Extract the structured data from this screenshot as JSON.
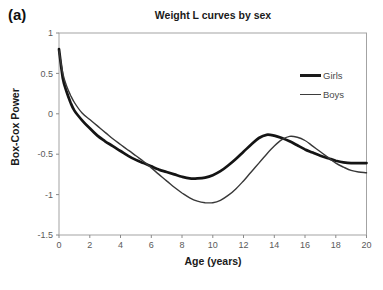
{
  "figure": {
    "panel_label": "(a)"
  },
  "chart_data": {
    "type": "line",
    "title": "Weight L curves by sex",
    "xlabel": "Age (years)",
    "ylabel": "Box-Cox Power",
    "xlim": [
      0,
      20
    ],
    "ylim": [
      -1.5,
      1
    ],
    "x_ticks": [
      0,
      2,
      4,
      6,
      8,
      10,
      12,
      14,
      16,
      18,
      20
    ],
    "y_ticks": [
      1,
      0.5,
      0,
      -0.5,
      -1,
      -1.5
    ],
    "y_tick_labels": [
      "1",
      "0.5",
      "0",
      "-0.5",
      "-1",
      "-1.5"
    ],
    "grid": false,
    "legend_position": "upper-right-inside",
    "x": [
      0,
      0.25,
      0.5,
      0.75,
      1,
      1.5,
      2,
      2.5,
      3,
      3.5,
      4,
      4.5,
      5,
      5.5,
      6,
      6.5,
      7,
      7.5,
      8,
      8.5,
      9,
      9.5,
      10,
      10.5,
      11,
      11.5,
      12,
      12.5,
      13,
      13.5,
      14,
      14.5,
      15,
      15.5,
      16,
      16.5,
      17,
      17.5,
      18,
      18.5,
      19,
      19.5,
      20
    ],
    "series": [
      {
        "name": "Girls",
        "style": "thick",
        "values": [
          0.8,
          0.44,
          0.27,
          0.14,
          0.04,
          -0.08,
          -0.18,
          -0.27,
          -0.34,
          -0.4,
          -0.46,
          -0.52,
          -0.57,
          -0.61,
          -0.65,
          -0.69,
          -0.72,
          -0.75,
          -0.78,
          -0.8,
          -0.8,
          -0.79,
          -0.76,
          -0.71,
          -0.64,
          -0.56,
          -0.47,
          -0.38,
          -0.3,
          -0.26,
          -0.27,
          -0.3,
          -0.34,
          -0.39,
          -0.44,
          -0.48,
          -0.52,
          -0.55,
          -0.58,
          -0.6,
          -0.61,
          -0.61,
          -0.61
        ]
      },
      {
        "name": "Boys",
        "style": "thin",
        "values": [
          0.78,
          0.5,
          0.34,
          0.23,
          0.14,
          0.01,
          -0.07,
          -0.15,
          -0.23,
          -0.31,
          -0.38,
          -0.45,
          -0.52,
          -0.59,
          -0.67,
          -0.75,
          -0.83,
          -0.91,
          -0.98,
          -1.04,
          -1.08,
          -1.1,
          -1.1,
          -1.07,
          -1.01,
          -0.93,
          -0.83,
          -0.72,
          -0.61,
          -0.5,
          -0.4,
          -0.32,
          -0.28,
          -0.29,
          -0.33,
          -0.4,
          -0.47,
          -0.54,
          -0.61,
          -0.66,
          -0.7,
          -0.72,
          -0.73
        ]
      }
    ]
  }
}
